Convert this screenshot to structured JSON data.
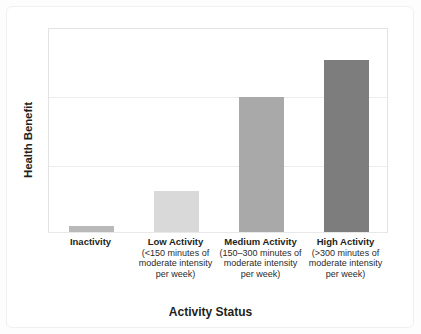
{
  "chart_data": {
    "type": "bar",
    "title": "",
    "xlabel": "Activity Status",
    "ylabel": "Health Benefit",
    "categories": [
      "Inactivity",
      "Low Activity",
      "Medium Activity",
      "High Activity"
    ],
    "category_details": [
      "",
      "(<150 minutes of moderate intensity per week)",
      "(150–300 minutes of moderate intensity per week)",
      "(>300 minutes of moderate intensity per week)"
    ],
    "values": [
      3,
      20,
      66,
      84
    ],
    "ylim": [
      0,
      100
    ],
    "grid": true,
    "gridlines": [
      33,
      66
    ],
    "axis_ticks_shown": false,
    "legend": "none",
    "bar_colors": [
      "#b9b9b9",
      "#d9d9d9",
      "#a9a9a9",
      "#7d7d7d"
    ]
  },
  "axes": {
    "y_title": "Health Benefit",
    "x_title": "Activity Status"
  },
  "bars": [
    {
      "name": "Inactivity",
      "label": "Inactivity",
      "detail_lines": [],
      "value": 3,
      "color": "#b9b9b9"
    },
    {
      "name": "Low Activity",
      "label": "Low Activity",
      "detail_lines": [
        "(<150 minutes of",
        "moderate intensity",
        "per week)"
      ],
      "value": 20,
      "color": "#d9d9d9"
    },
    {
      "name": "Medium Activity",
      "label": "Medium Activity",
      "detail_lines": [
        "(150–300 minutes of",
        "moderate intensity",
        "per week)"
      ],
      "value": 66,
      "color": "#a9a9a9"
    },
    {
      "name": "High Activity",
      "label": "High Activity",
      "detail_lines": [
        "(>300 minutes of",
        "moderate intensity",
        "per week)"
      ],
      "value": 84,
      "color": "#7d7d7d"
    }
  ],
  "colors": {
    "text": "#231f20",
    "plot_border": "#e3e3e3",
    "gridline": "#ededed",
    "background": "#ffffff"
  }
}
